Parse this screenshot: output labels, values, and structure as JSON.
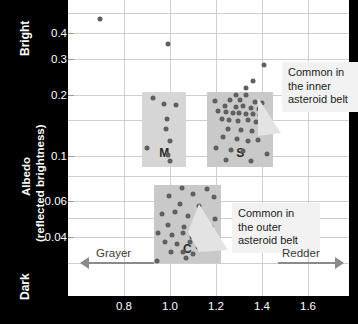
{
  "chart_data": {
    "type": "scatter",
    "title": "",
    "xlabel": "",
    "ylabel": "Albedo (reflected brightness)",
    "yscale": "log",
    "ylim": [
      0.028,
      0.55
    ],
    "xlim": [
      0.62,
      1.72
    ],
    "grid": true,
    "legend_position": "none",
    "y_ticks": [
      {
        "label": "0.4",
        "value": 0.4
      },
      {
        "label": "0.3",
        "value": 0.3
      },
      {
        "label": "0.2",
        "value": 0.2
      },
      {
        "label": "0.1",
        "value": 0.1
      },
      {
        "label": "0.06",
        "value": 0.06
      },
      {
        "label": "0.04",
        "value": 0.04
      }
    ],
    "x_ticks": [
      {
        "label": "0.8",
        "value": 0.8
      },
      {
        "label": "1.0",
        "value": 1.0
      },
      {
        "label": "1.2",
        "value": 1.2
      },
      {
        "label": "1.4",
        "value": 1.4
      },
      {
        "label": "1.6",
        "value": 1.6
      }
    ],
    "axis_end_labels": {
      "y_top": "Bright",
      "y_bottom": "Dark"
    },
    "direction_arrows": [
      {
        "label": "Grayer",
        "direction": "left"
      },
      {
        "label": "Redder",
        "direction": "right"
      }
    ],
    "groups": [
      {
        "name": "M",
        "label": "M",
        "x_range": [
          0.88,
          1.07
        ],
        "albedo_range": [
          0.088,
          0.205
        ],
        "box_color": "#d6d6d6",
        "points": [
          {
            "x": 0.925,
            "y": 0.192
          },
          {
            "x": 0.975,
            "y": 0.18
          },
          {
            "x": 1.025,
            "y": 0.178
          },
          {
            "x": 0.985,
            "y": 0.152
          },
          {
            "x": 0.982,
            "y": 0.136
          },
          {
            "x": 1.0,
            "y": 0.118
          },
          {
            "x": 0.9,
            "y": 0.109
          },
          {
            "x": 0.992,
            "y": 0.101
          },
          {
            "x": 1.002,
            "y": 0.095
          }
        ]
      },
      {
        "name": "S",
        "label": "S",
        "x_range": [
          1.16,
          1.45
        ],
        "albedo_range": [
          0.088,
          0.205
        ],
        "box_color": "#c9c9c9",
        "points": [
          {
            "x": 1.285,
            "y": 0.2
          },
          {
            "x": 1.33,
            "y": 0.198
          },
          {
            "x": 1.196,
            "y": 0.186
          },
          {
            "x": 1.262,
            "y": 0.188
          },
          {
            "x": 1.305,
            "y": 0.187
          },
          {
            "x": 1.37,
            "y": 0.183
          },
          {
            "x": 1.4,
            "y": 0.181
          },
          {
            "x": 1.24,
            "y": 0.176
          },
          {
            "x": 1.288,
            "y": 0.174
          },
          {
            "x": 1.318,
            "y": 0.175
          },
          {
            "x": 1.352,
            "y": 0.172
          },
          {
            "x": 1.388,
            "y": 0.17
          },
          {
            "x": 1.208,
            "y": 0.166
          },
          {
            "x": 1.242,
            "y": 0.164
          },
          {
            "x": 1.272,
            "y": 0.163
          },
          {
            "x": 1.3,
            "y": 0.162
          },
          {
            "x": 1.33,
            "y": 0.161
          },
          {
            "x": 1.36,
            "y": 0.16
          },
          {
            "x": 1.392,
            "y": 0.158
          },
          {
            "x": 1.225,
            "y": 0.152
          },
          {
            "x": 1.258,
            "y": 0.15
          },
          {
            "x": 1.296,
            "y": 0.149
          },
          {
            "x": 1.338,
            "y": 0.15
          },
          {
            "x": 1.374,
            "y": 0.147
          },
          {
            "x": 1.408,
            "y": 0.144
          },
          {
            "x": 1.25,
            "y": 0.136
          },
          {
            "x": 1.31,
            "y": 0.134
          },
          {
            "x": 1.356,
            "y": 0.133
          },
          {
            "x": 1.232,
            "y": 0.124
          },
          {
            "x": 1.29,
            "y": 0.121
          },
          {
            "x": 1.338,
            "y": 0.118
          },
          {
            "x": 1.382,
            "y": 0.12
          },
          {
            "x": 1.2,
            "y": 0.11
          },
          {
            "x": 1.266,
            "y": 0.107
          },
          {
            "x": 1.318,
            "y": 0.106
          },
          {
            "x": 1.42,
            "y": 0.102
          },
          {
            "x": 1.244,
            "y": 0.096
          },
          {
            "x": 1.352,
            "y": 0.094
          }
        ]
      },
      {
        "name": "C",
        "label": "C",
        "x_range": [
          0.93,
          1.22
        ],
        "albedo_range": [
          0.03,
          0.072
        ],
        "box_color": "#c9c9c9",
        "points": [
          {
            "x": 1.05,
            "y": 0.07
          },
          {
            "x": 1.16,
            "y": 0.069
          },
          {
            "x": 0.995,
            "y": 0.064
          },
          {
            "x": 1.1,
            "y": 0.065
          },
          {
            "x": 1.19,
            "y": 0.063
          },
          {
            "x": 1.045,
            "y": 0.058
          },
          {
            "x": 1.128,
            "y": 0.057
          },
          {
            "x": 0.965,
            "y": 0.052
          },
          {
            "x": 1.02,
            "y": 0.053
          },
          {
            "x": 1.078,
            "y": 0.051
          },
          {
            "x": 1.148,
            "y": 0.05
          },
          {
            "x": 1.196,
            "y": 0.049
          },
          {
            "x": 0.99,
            "y": 0.046
          },
          {
            "x": 1.062,
            "y": 0.045
          },
          {
            "x": 1.108,
            "y": 0.046
          },
          {
            "x": 1.14,
            "y": 0.044
          },
          {
            "x": 1.178,
            "y": 0.045
          },
          {
            "x": 0.948,
            "y": 0.042
          },
          {
            "x": 1.008,
            "y": 0.041
          },
          {
            "x": 1.058,
            "y": 0.042
          },
          {
            "x": 1.096,
            "y": 0.04
          },
          {
            "x": 1.132,
            "y": 0.041
          },
          {
            "x": 1.17,
            "y": 0.04
          },
          {
            "x": 0.978,
            "y": 0.038
          },
          {
            "x": 1.032,
            "y": 0.037
          },
          {
            "x": 1.086,
            "y": 0.038
          },
          {
            "x": 1.122,
            "y": 0.036
          },
          {
            "x": 1.158,
            "y": 0.037
          },
          {
            "x": 1.004,
            "y": 0.034
          },
          {
            "x": 1.055,
            "y": 0.034
          },
          {
            "x": 1.1,
            "y": 0.033
          },
          {
            "x": 1.07,
            "y": 0.0315
          },
          {
            "x": 0.945,
            "y": 0.0305
          }
        ]
      }
    ],
    "outliers": [
      {
        "x": 0.695,
        "y": 0.47
      },
      {
        "x": 0.99,
        "y": 0.352
      },
      {
        "x": 1.41,
        "y": 0.278
      },
      {
        "x": 1.36,
        "y": 0.232
      },
      {
        "x": 1.33,
        "y": 0.215
      }
    ]
  },
  "annotations": [
    {
      "id": "inner-belt",
      "text": "Common in\nthe inner\nasteroid belt"
    },
    {
      "id": "outer-belt",
      "text": "Common in\nthe outer\nasteroid belt"
    }
  ]
}
